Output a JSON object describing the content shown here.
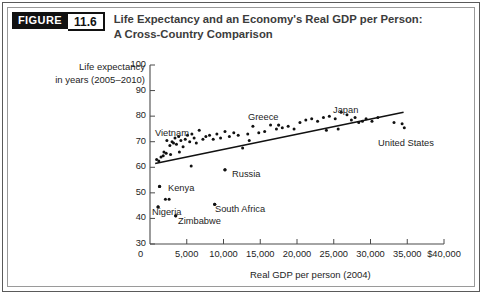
{
  "header": {
    "figure_tag": "FIGURE",
    "figure_number": "11.6",
    "title": "Life Expectancy and an Economy's Real GDP per Person: A Cross-Country Comparison"
  },
  "chart_data": {
    "type": "scatter",
    "title": "Life Expectancy and an Economy's Real GDP per Person: A Cross-Country Comparison",
    "ylabel_line1": "Life expectancy",
    "ylabel_line2": "in years (2005–2010)",
    "xlabel": "Real GDP per person (2004)",
    "xlim": [
      0,
      40000
    ],
    "ylim": [
      30,
      100
    ],
    "grid": false,
    "legend": "none",
    "ytick_labels": [
      "100",
      "90",
      "80",
      "70",
      "60",
      "50",
      "40",
      "30"
    ],
    "ytick_values": [
      100,
      90,
      80,
      70,
      60,
      50,
      40,
      30
    ],
    "xtick_labels": [
      "0",
      "5,000",
      "10,000",
      "15,000",
      "20,000",
      "25,000",
      "30,000",
      "35,000",
      "$40,000"
    ],
    "xtick_values": [
      0,
      5000,
      10000,
      15000,
      20000,
      25000,
      30000,
      35000,
      40000
    ],
    "origin_label": "0",
    "trendline": {
      "label": "fitted line",
      "x": [
        700,
        34500
      ],
      "y": [
        61.5,
        81.5
      ]
    },
    "annotations": [
      {
        "label": "Vietnam",
        "x": 2500,
        "y": 71.5
      },
      {
        "label": "Greece",
        "x": 17500,
        "y": 79.0
      },
      {
        "label": "Japan",
        "x": 26500,
        "y": 82.5
      },
      {
        "label": "United States",
        "x": 33500,
        "y": 71.5
      },
      {
        "label": "Russia",
        "x": 10500,
        "y": 58.5
      },
      {
        "label": "Kenya",
        "x": 2200,
        "y": 52.5
      },
      {
        "label": "Nigeria",
        "x": 1700,
        "y": 43.0
      },
      {
        "label": "Zimbabwe",
        "x": 4500,
        "y": 40.5
      },
      {
        "label": "South Africa",
        "x": 10000,
        "y": 45.5
      }
    ],
    "points": [
      {
        "x": 900,
        "y": 63.0
      },
      {
        "x": 1200,
        "y": 62.5
      },
      {
        "x": 1500,
        "y": 64.0
      },
      {
        "x": 1800,
        "y": 64.5
      },
      {
        "x": 2300,
        "y": 70.5
      },
      {
        "x": 2700,
        "y": 68.5
      },
      {
        "x": 3000,
        "y": 70.0
      },
      {
        "x": 3200,
        "y": 69.5
      },
      {
        "x": 3400,
        "y": 71.5
      },
      {
        "x": 3600,
        "y": 69.0
      },
      {
        "x": 3900,
        "y": 72.0
      },
      {
        "x": 4200,
        "y": 70.5
      },
      {
        "x": 4500,
        "y": 68.0
      },
      {
        "x": 4800,
        "y": 71.0
      },
      {
        "x": 5100,
        "y": 72.5
      },
      {
        "x": 5400,
        "y": 70.0
      },
      {
        "x": 5700,
        "y": 73.0
      },
      {
        "x": 6000,
        "y": 71.5
      },
      {
        "x": 6300,
        "y": 69.5
      },
      {
        "x": 6700,
        "y": 74.5
      },
      {
        "x": 7200,
        "y": 71.0
      },
      {
        "x": 7600,
        "y": 72.0
      },
      {
        "x": 8100,
        "y": 72.5
      },
      {
        "x": 8600,
        "y": 71.0
      },
      {
        "x": 9100,
        "y": 73.0
      },
      {
        "x": 9600,
        "y": 71.5
      },
      {
        "x": 10200,
        "y": 74.0
      },
      {
        "x": 10800,
        "y": 72.0
      },
      {
        "x": 11400,
        "y": 73.5
      },
      {
        "x": 12000,
        "y": 72.5
      },
      {
        "x": 12600,
        "y": 67.5
      },
      {
        "x": 13300,
        "y": 73.0
      },
      {
        "x": 14000,
        "y": 76.0
      },
      {
        "x": 14800,
        "y": 73.5
      },
      {
        "x": 15600,
        "y": 74.0
      },
      {
        "x": 16400,
        "y": 76.5
      },
      {
        "x": 17200,
        "y": 75.0
      },
      {
        "x": 18000,
        "y": 75.5
      },
      {
        "x": 18800,
        "y": 76.0
      },
      {
        "x": 19600,
        "y": 75.0
      },
      {
        "x": 20400,
        "y": 77.5
      },
      {
        "x": 21200,
        "y": 78.5
      },
      {
        "x": 22000,
        "y": 79.0
      },
      {
        "x": 22800,
        "y": 78.0
      },
      {
        "x": 23600,
        "y": 79.5
      },
      {
        "x": 24400,
        "y": 80.0
      },
      {
        "x": 25200,
        "y": 79.0
      },
      {
        "x": 26000,
        "y": 81.5
      },
      {
        "x": 26800,
        "y": 80.5
      },
      {
        "x": 27400,
        "y": 78.5
      },
      {
        "x": 27900,
        "y": 79.5
      },
      {
        "x": 28400,
        "y": 77.5
      },
      {
        "x": 28900,
        "y": 78.0
      },
      {
        "x": 29400,
        "y": 79.0
      },
      {
        "x": 30200,
        "y": 78.0
      },
      {
        "x": 31000,
        "y": 79.5
      },
      {
        "x": 33200,
        "y": 77.5
      },
      {
        "x": 34300,
        "y": 77.0
      },
      {
        "x": 34600,
        "y": 75.5
      },
      {
        "x": 10200,
        "y": 59.0
      },
      {
        "x": 5600,
        "y": 60.5
      },
      {
        "x": 1300,
        "y": 52.5
      },
      {
        "x": 2100,
        "y": 47.5
      },
      {
        "x": 2600,
        "y": 47.5
      },
      {
        "x": 1100,
        "y": 44.5
      },
      {
        "x": 3500,
        "y": 41.0
      },
      {
        "x": 8800,
        "y": 45.5
      },
      {
        "x": 2200,
        "y": 65.5
      },
      {
        "x": 2800,
        "y": 65.0
      },
      {
        "x": 1900,
        "y": 66.0
      },
      {
        "x": 4000,
        "y": 66.0
      },
      {
        "x": 13500,
        "y": 70.5
      },
      {
        "x": 24000,
        "y": 74.5
      },
      {
        "x": 25600,
        "y": 75.0
      }
    ]
  }
}
